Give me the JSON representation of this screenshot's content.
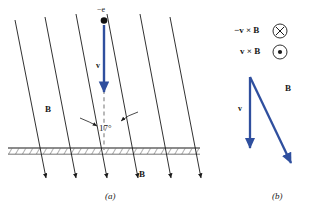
{
  "figure": {
    "title_caption_a": "(a)",
    "title_caption_b": "(b)",
    "colors": {
      "vector_blue": "#2f4f9e",
      "line_black": "#1a1a1a",
      "dash_gray": "#8a8a8a",
      "background": "#ffffff"
    }
  },
  "panel_a": {
    "caption": "(a)",
    "electron_label": "−e",
    "velocity_label": "v",
    "field_label_left": "B",
    "field_label_bottom": "B",
    "angle_label": "17°",
    "angle_value": 17,
    "field_line_count": 6,
    "field_line_tilt_deg": 17,
    "ground_line_y": 148,
    "description": "Electron moving straight down with velocity v through tilted magnetic field lines B, meeting hatched ground surface at 17 degrees."
  },
  "panel_b": {
    "caption": "(b)",
    "cross_label_top": "−v × B",
    "cross_label_bottom": "v × B",
    "symbol_top": "⊗",
    "symbol_bottom": "⊙",
    "symbol_top_name": "into-page-circle-x",
    "symbol_bottom_name": "out-of-page-circle-dot",
    "velocity_label": "v",
    "field_label": "B",
    "description": "Vector diagram showing v pointing down and B pointing down-right, with circled cross and circled dot for cross product directions."
  }
}
